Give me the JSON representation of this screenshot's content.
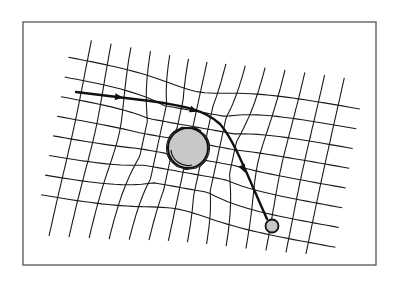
{
  "diagram": {
    "title": "",
    "frame": {
      "x": 23,
      "y": 22,
      "width": 353,
      "height": 243,
      "stroke": "#555555"
    },
    "colors": {
      "background": "#ffffff",
      "grid": "#1a1a1a",
      "path": "#111111",
      "body_fill": "#c8c8c8",
      "body_stroke": "#111111"
    },
    "grid": {
      "horizontal_lines": 8,
      "vertical_lines": 14,
      "distorted_near": "large-mass"
    },
    "large_mass": {
      "cx": 188,
      "cy": 148,
      "r": 20
    },
    "small_body": {
      "cx": 272,
      "cy": 226,
      "r": 6.5
    },
    "trajectory": {
      "start": [
        76,
        92
      ],
      "end": [
        267,
        219
      ],
      "arrows": [
        [
          118,
          97
        ],
        [
          193,
          110
        ],
        [
          243,
          168
        ]
      ]
    }
  }
}
